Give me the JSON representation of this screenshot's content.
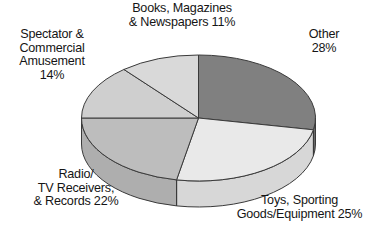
{
  "chart_data": {
    "type": "pie",
    "title": "",
    "subtitle": "",
    "xlabel": "",
    "ylabel": "",
    "legend_position": "none",
    "grid": false,
    "style": "3d-exploded-none",
    "start_angle_deg": 0,
    "direction": "clockwise",
    "categories": [
      "Other",
      "Toys, Sporting Goods/Equipment",
      "Radio/TV Receivers, & Records",
      "Spectator & Commercial Amusement",
      "Books, Magazines & Newspapers"
    ],
    "values": [
      28,
      25,
      22,
      14,
      11
    ],
    "units": "percent",
    "total": 100,
    "slice_colors": [
      "#808080",
      "#e9e9e9",
      "#bdbdbd",
      "#cfcfcf",
      "#d9d9d9"
    ],
    "side_colors": [
      "#6a6a6a",
      "#d7d7d7",
      "#aeaeae",
      "#c0c0c0",
      "#cacaca"
    ],
    "outline_color": "#3a3a3a",
    "slices": [
      {
        "label": "Other",
        "value": 28,
        "color": "#808080"
      },
      {
        "label": "Toys, Sporting Goods/Equipment",
        "value": 25,
        "color": "#e9e9e9"
      },
      {
        "label": "Radio/TV Receivers, & Records",
        "value": 22,
        "color": "#bdbdbd"
      },
      {
        "label": "Spectator & Commercial Amusement",
        "value": 14,
        "color": "#cfcfcf"
      },
      {
        "label": "Books, Magazines & Newspapers",
        "value": 11,
        "color": "#d9d9d9"
      }
    ]
  },
  "labels": {
    "books": "Books, Magazines\n& Newspapers 11%",
    "other": "Other\n28%",
    "spectator": "Spectator &\nCommercial\nAmusement\n14%",
    "radio": "Radio/\nTV Receivers,\n& Records 22%",
    "toys": "Toys, Sporting\nGoods/Equipment 25%"
  }
}
